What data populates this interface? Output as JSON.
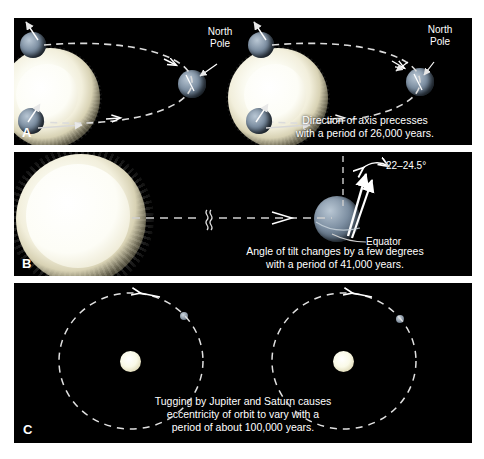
{
  "figure": {
    "background_color": "#ffffff",
    "panel_color": "#000000",
    "text_color": "#ffffff"
  },
  "panels": [
    {
      "id": "A",
      "letter": "A",
      "topic": "axial precession",
      "caption": "Direction of axis precesses\nwith a period of 26,000 years.",
      "caption_line1": "Direction of axis precesses",
      "caption_line2": "with a period of 26,000 years.",
      "period_years": "26,000",
      "labels": [
        {
          "text": "North\nPole",
          "line1": "North",
          "line2": "Pole",
          "position": "left-scene"
        },
        {
          "text": "North\nPole",
          "line1": "North",
          "line2": "Pole",
          "position": "right-scene"
        }
      ],
      "scenes": [
        {
          "name": "precession-state-1",
          "sun": "left",
          "earth_positions": 2,
          "orbit": "ellipse"
        },
        {
          "name": "precession-state-2",
          "sun": "left",
          "earth_positions": 2,
          "orbit": "ellipse"
        }
      ]
    },
    {
      "id": "B",
      "letter": "B",
      "topic": "axial tilt (obliquity)",
      "caption_line1": "Angle of tilt changes by a few degrees",
      "caption_line2": "with a period of 41,000 years.",
      "period_years": "41,000",
      "tilt_range_label": "22–24.5°",
      "equator_label": "Equator",
      "break_symbol": "≈",
      "elements": [
        "large-sun",
        "dashed-sight-line",
        "break-mark",
        "arrowhead",
        "earth",
        "tilt-arrows",
        "vertical-reference"
      ]
    },
    {
      "id": "C",
      "letter": "C",
      "topic": "orbital eccentricity",
      "caption_line1": "Tugging by Jupiter and Saturn causes",
      "caption_line2": "eccentricity of orbit to vary with a",
      "caption_line3": "period of about 100,000 years.",
      "period_years": "100,000",
      "orbits": [
        {
          "name": "orbit-left",
          "shape": "near-circular",
          "sun": "center",
          "earth_marker": true
        },
        {
          "name": "orbit-right",
          "shape": "near-circular",
          "sun": "center",
          "earth_marker": true
        }
      ]
    }
  ]
}
